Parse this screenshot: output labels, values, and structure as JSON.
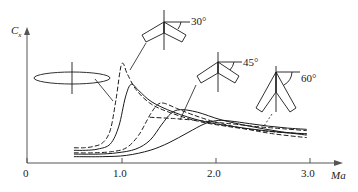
{
  "figure": {
    "title": "",
    "y_axis_label": "C",
    "y_axis_sublabel": "x",
    "x_axis_label": "Ma"
  },
  "axes": {
    "x_ticks": [
      {
        "value": 0,
        "label": "0"
      },
      {
        "value": 1.0,
        "label": "1.0"
      },
      {
        "value": 2.0,
        "label": "2.0"
      },
      {
        "value": 3.0,
        "label": "3.0"
      }
    ]
  },
  "annotations": [
    {
      "id": "wing-straight",
      "label": "",
      "sweep_deg": 0
    },
    {
      "id": "wing-30",
      "label": "30°",
      "sweep_deg": 30
    },
    {
      "id": "wing-45",
      "label": "45°",
      "sweep_deg": 45
    },
    {
      "id": "wing-60",
      "label": "60°",
      "sweep_deg": 60
    }
  ],
  "colors": {
    "line": "#1a1a1a",
    "axis": "#555555",
    "background": "#ffffff"
  },
  "chart_data": {
    "type": "line",
    "title": "",
    "xlabel": "Ma",
    "ylabel": "Cx",
    "xlim": [
      0,
      3.2
    ],
    "ylim": [
      0,
      1.0
    ],
    "grid": false,
    "legend": "none",
    "annotations": [
      "30°",
      "45°",
      "60°"
    ],
    "series": [
      {
        "name": "straight wing (dashed)",
        "style": "dashed",
        "sweep_deg": 0,
        "x": [
          0.5,
          0.6,
          0.7,
          0.8,
          0.88,
          0.94,
          1.0,
          1.06,
          1.15,
          1.3,
          1.5,
          1.8,
          2.1,
          2.4,
          2.7,
          2.95
        ],
        "y": [
          0.12,
          0.12,
          0.13,
          0.16,
          0.26,
          0.5,
          0.78,
          0.7,
          0.58,
          0.47,
          0.4,
          0.33,
          0.29,
          0.26,
          0.24,
          0.23
        ]
      },
      {
        "name": "straight wing (solid)",
        "style": "solid",
        "sweep_deg": 0,
        "x": [
          0.5,
          0.62,
          0.75,
          0.88,
          0.97,
          1.04,
          1.1,
          1.18,
          1.32,
          1.55,
          1.85,
          2.15,
          2.45,
          2.72,
          2.95
        ],
        "y": [
          0.1,
          0.1,
          0.11,
          0.15,
          0.29,
          0.52,
          0.62,
          0.57,
          0.48,
          0.4,
          0.33,
          0.29,
          0.26,
          0.24,
          0.23
        ]
      },
      {
        "name": "30-45 deg swept (dashed)",
        "style": "dashed",
        "sweep_deg": 40,
        "x": [
          0.5,
          0.7,
          0.9,
          1.05,
          1.18,
          1.3,
          1.38,
          1.45,
          1.58,
          1.75,
          2.0,
          2.3,
          2.6,
          2.95
        ],
        "y": [
          0.08,
          0.08,
          0.09,
          0.12,
          0.22,
          0.38,
          0.46,
          0.47,
          0.43,
          0.38,
          0.32,
          0.27,
          0.23,
          0.2
        ]
      },
      {
        "name": "45 deg swept (solid)",
        "style": "solid",
        "sweep_deg": 45,
        "x": [
          0.5,
          0.75,
          0.95,
          1.15,
          1.3,
          1.42,
          1.52,
          1.62,
          1.8,
          2.05,
          2.35,
          2.65,
          2.95
        ],
        "y": [
          0.07,
          0.07,
          0.08,
          0.11,
          0.18,
          0.3,
          0.39,
          0.42,
          0.4,
          0.34,
          0.29,
          0.25,
          0.22
        ]
      },
      {
        "name": "60 deg swept (solid)",
        "style": "solid",
        "sweep_deg": 60,
        "x": [
          0.5,
          0.8,
          1.05,
          1.3,
          1.5,
          1.7,
          1.88,
          2.02,
          2.15,
          2.35,
          2.55,
          2.75,
          2.95
        ],
        "y": [
          0.05,
          0.05,
          0.06,
          0.1,
          0.16,
          0.24,
          0.31,
          0.335,
          0.33,
          0.31,
          0.29,
          0.275,
          0.265
        ]
      },
      {
        "name": "60 deg swept (dashed)",
        "style": "dashed",
        "sweep_deg": 60,
        "x": [
          1.3,
          1.55,
          1.8,
          2.0,
          2.2,
          2.45,
          2.7,
          2.95
        ],
        "y": [
          0.36,
          0.35,
          0.335,
          0.32,
          0.305,
          0.285,
          0.27,
          0.255
        ]
      }
    ]
  }
}
